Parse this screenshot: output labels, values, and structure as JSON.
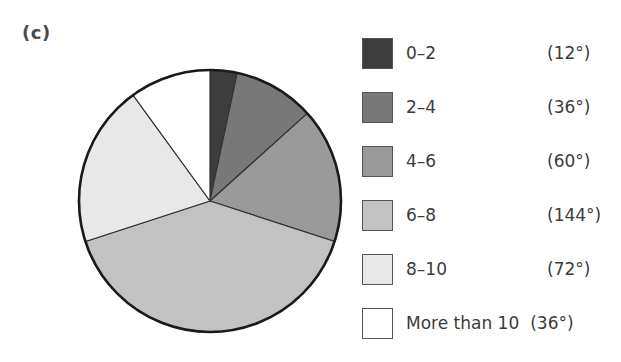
{
  "panel": {
    "label": "(c)"
  },
  "chart_data": {
    "type": "pie",
    "title": "",
    "start_angle_deg": 0,
    "direction": "clockwise",
    "total_deg": 360,
    "xlabel": "",
    "ylabel": "",
    "legend_position": "right",
    "grid": false,
    "categories": [
      "0–2",
      "2–4",
      "4–6",
      "6–8",
      "8–10",
      "More than 10"
    ],
    "values_deg": [
      12,
      36,
      60,
      144,
      72,
      36
    ],
    "values_pct": [
      3.33,
      10.0,
      16.67,
      40.0,
      20.0,
      10.0
    ],
    "slice_colors": [
      "#3d3d3d",
      "#787878",
      "#9a9a9a",
      "#c2c2c2",
      "#e8e8e8",
      "#ffffff"
    ],
    "slice_stroke": "#333333",
    "outline_color": "#1a1a1a",
    "slices": [
      {
        "label": "0–2",
        "degrees_text": "(12°)",
        "degrees": 12,
        "color": "#3d3d3d",
        "inline_degrees": false
      },
      {
        "label": "2–4",
        "degrees_text": "(36°)",
        "degrees": 36,
        "color": "#787878",
        "inline_degrees": false
      },
      {
        "label": "4–6",
        "degrees_text": "(60°)",
        "degrees": 60,
        "color": "#9a9a9a",
        "inline_degrees": false
      },
      {
        "label": "6–8",
        "degrees_text": "(144°)",
        "degrees": 144,
        "color": "#c2c2c2",
        "inline_degrees": false
      },
      {
        "label": "8–10",
        "degrees_text": "(72°)",
        "degrees": 72,
        "color": "#e8e8e8",
        "inline_degrees": false
      },
      {
        "label": "More than 10",
        "degrees_text": "(36°)",
        "degrees": 36,
        "color": "#ffffff",
        "inline_degrees": true
      }
    ]
  }
}
